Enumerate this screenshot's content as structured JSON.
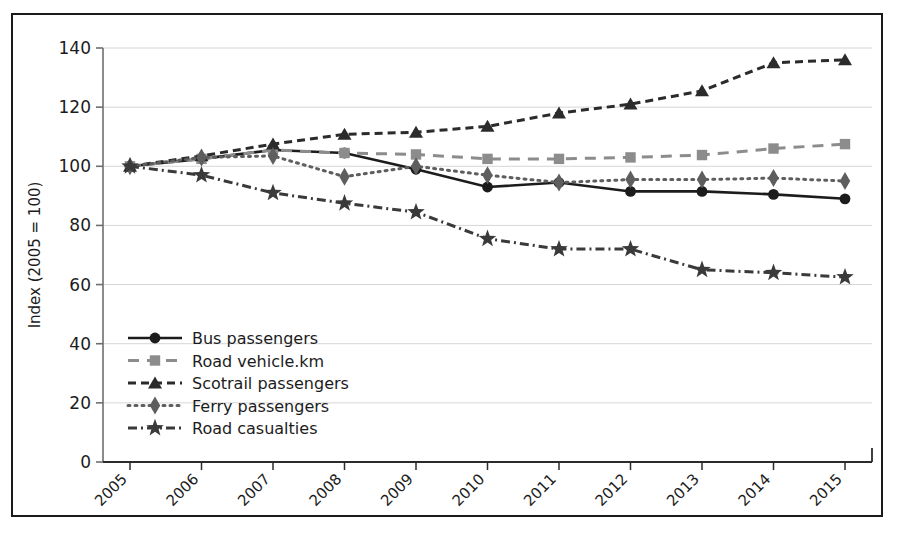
{
  "chart_data": {
    "type": "line",
    "title": "",
    "xlabel": "",
    "ylabel": "Index (2005 = 100)",
    "categories": [
      "2005",
      "2006",
      "2007",
      "2008",
      "2009",
      "2010",
      "2011",
      "2012",
      "2013",
      "2014",
      "2015"
    ],
    "ylim": [
      0,
      140
    ],
    "ytick_step": 20,
    "yticks": [
      "0",
      "20",
      "40",
      "60",
      "80",
      "100",
      "120",
      "140"
    ],
    "grid": "horizontal",
    "legend_position": "inside-lower-left",
    "series": [
      {
        "name": "Bus passengers",
        "marker": "circle",
        "line_style": "solid",
        "color": "#1c1c1c",
        "values": [
          100,
          102.5,
          105.5,
          104.5,
          99,
          93,
          94.5,
          91.5,
          91.5,
          90.5,
          89
        ]
      },
      {
        "name": "Road vehicle.km",
        "marker": "square",
        "line_style": "dashed",
        "color": "#8c8c8c",
        "values": [
          100,
          102.5,
          105.5,
          104.5,
          104,
          102.5,
          102.5,
          103,
          103.8,
          106,
          107.5
        ]
      },
      {
        "name": "Scotrail passengers",
        "marker": "triangle",
        "line_style": "dashed-short",
        "color": "#2b2b2b",
        "values": [
          100,
          103.5,
          107.5,
          110.8,
          111.5,
          113.5,
          118,
          121,
          125.5,
          135,
          136
        ]
      },
      {
        "name": "Ferry passengers",
        "marker": "diamond",
        "line_style": "dotted",
        "color": "#5e5e5e",
        "values": [
          100,
          103,
          103.5,
          96.5,
          100,
          97,
          94.5,
          95.5,
          95.5,
          96,
          95
        ]
      },
      {
        "name": "Road casualties",
        "marker": "star",
        "line_style": "dash-dot",
        "color": "#3a3a3a",
        "values": [
          100,
          97,
          91,
          87.5,
          84.5,
          75.5,
          72,
          72,
          65,
          64,
          62.5
        ]
      }
    ]
  },
  "legend": {
    "items": [
      {
        "label": "Bus passengers"
      },
      {
        "label": "Road vehicle.km"
      },
      {
        "label": "Scotrail passengers"
      },
      {
        "label": "Ferry passengers"
      },
      {
        "label": "Road casualties"
      }
    ]
  }
}
